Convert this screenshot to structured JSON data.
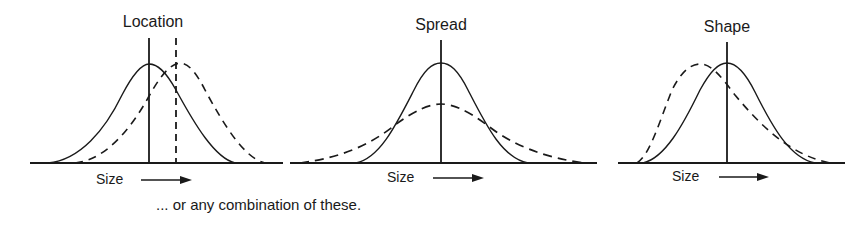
{
  "panels": [
    {
      "title": "Location",
      "axis_label": "Size",
      "comparison": "shift in location (dashed curve shifted right)"
    },
    {
      "title": "Spread",
      "axis_label": "Size",
      "comparison": "wider spread (dashed curve flatter and wider)"
    },
    {
      "title": "Shape",
      "axis_label": "Size",
      "comparison": "different shape (dashed curve skewed)"
    }
  ],
  "caption": "... or any combination of these.",
  "colors": {
    "ink": "#1a1a1a",
    "background": "#ffffff"
  }
}
